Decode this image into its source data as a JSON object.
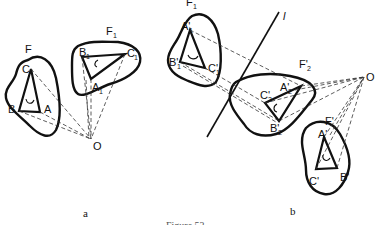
{
  "figure": {
    "caption": "Figure 53",
    "panels": [
      {
        "id": "a",
        "label": "a",
        "figures": [
          {
            "name": "F",
            "vertices": [
              "A",
              "B",
              "C"
            ],
            "orientation": "clockwise arrow"
          },
          {
            "name": "F",
            "subscript": "1",
            "vertices": [
              "A1",
              "B1",
              "C1"
            ],
            "orientation": "counterclockwise arrow"
          }
        ],
        "center": "O"
      },
      {
        "id": "b",
        "label": "b",
        "line": "l",
        "figures": [
          {
            "name": "F",
            "subscript": "1",
            "vertices": [
              "A'1",
              "B'1",
              "C'1"
            ]
          },
          {
            "name": "F'",
            "subscript": "2",
            "vertices": [
              "A'2",
              "B'2",
              "C'2"
            ]
          },
          {
            "name": "F'",
            "vertices": [
              "A'",
              "B'",
              "C'"
            ]
          }
        ],
        "center": "O"
      }
    ]
  },
  "labels": {
    "a": {
      "F": "F",
      "F1": "F",
      "F1_sub": "1",
      "A": "A",
      "B": "B",
      "C": "C",
      "A1": "A",
      "A1_sub": "1",
      "B1": "B",
      "B1_sub": "1",
      "C1": "C",
      "C1_sub": "1",
      "O": "O",
      "panel": "a"
    },
    "b": {
      "F1": "F",
      "F1_sub": "1",
      "A1p": "A'",
      "A1p_sub": "1",
      "B1p": "B'",
      "B1p_sub": "1",
      "C1p": "C'",
      "C1p_sub": "1",
      "l": "l",
      "F2p": "F'",
      "F2p_sub": "2",
      "A2p": "A'",
      "A2p_sub": "2",
      "B2p": "B'",
      "B2p_sub": "2",
      "C2p": "C'",
      "C2p_sub": "2",
      "Fp": "F'",
      "Ap": "A'",
      "Bp": "B'",
      "Cp": "C'",
      "O": "O",
      "panel": "b"
    }
  }
}
